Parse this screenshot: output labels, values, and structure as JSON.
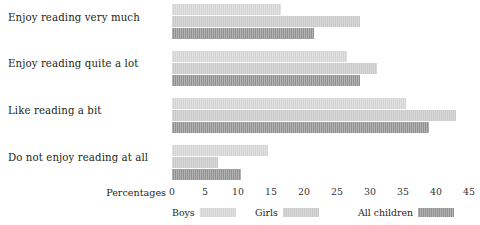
{
  "chart_data": {
    "type": "bar",
    "orientation": "horizontal",
    "title": "",
    "xlabel": "Percentages",
    "ylabel": "",
    "xlim": [
      0,
      45
    ],
    "xticks": [
      0,
      5,
      10,
      15,
      20,
      25,
      30,
      35,
      40,
      45
    ],
    "grid": false,
    "legend_position": "bottom",
    "categories": [
      "Enjoy reading very much",
      "Enjoy reading quite a lot",
      "Like reading a bit",
      "Do not enjoy reading at all"
    ],
    "series": [
      {
        "name": "Boys",
        "color": "#d4d4d4",
        "values": [
          16.5,
          26.5,
          35.5,
          14.5
        ]
      },
      {
        "name": "Girls",
        "color": "#c8c8c8",
        "values": [
          28.5,
          31.0,
          43.0,
          7.0
        ]
      },
      {
        "name": "All children",
        "color": "#919191",
        "values": [
          21.5,
          28.5,
          39.0,
          10.5
        ]
      }
    ]
  },
  "axis": {
    "title": "Percentages",
    "tick_labels": [
      "0",
      "5",
      "10",
      "15",
      "20",
      "25",
      "30",
      "35",
      "40",
      "45"
    ]
  },
  "legend": {
    "items": [
      {
        "label": "Boys"
      },
      {
        "label": "Girls"
      },
      {
        "label": "All children"
      }
    ]
  }
}
